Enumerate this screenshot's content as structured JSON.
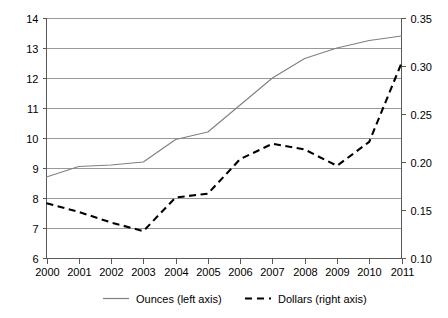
{
  "chart_data": {
    "type": "line",
    "title": "",
    "subtitle": "",
    "xlabel": "",
    "ylabel": "",
    "grid": true,
    "legend_position": "bottom",
    "categories": [
      "2000",
      "2001",
      "2002",
      "2003",
      "2004",
      "2005",
      "2006",
      "2007",
      "2008",
      "2009",
      "2010",
      "2011"
    ],
    "left_axis": {
      "label": "Ounces (left axis)",
      "ylim": [
        6,
        14
      ],
      "ticks": [
        "6",
        "7",
        "8",
        "9",
        "10",
        "11",
        "12",
        "13",
        "14"
      ],
      "tick_values": [
        6,
        7,
        8,
        9,
        10,
        11,
        12,
        13,
        14
      ]
    },
    "right_axis": {
      "label": "Dollars (right axis)",
      "ylim": [
        0.1,
        0.35
      ],
      "ticks": [
        "0.10",
        "0.15",
        "0.20",
        "0.25",
        "0.30",
        "0.35"
      ],
      "tick_values": [
        0.1,
        0.15,
        0.2,
        0.25,
        0.3,
        0.35
      ]
    },
    "series": [
      {
        "name": "Ounces (left axis)",
        "axis": "left",
        "style": "solid",
        "color": "#7f7f7f",
        "values": [
          8.7,
          9.05,
          9.1,
          9.2,
          9.95,
          10.2,
          11.1,
          12.0,
          12.65,
          13.0,
          13.25,
          13.4
        ]
      },
      {
        "name": "Dollars (right axis)",
        "axis": "right",
        "style": "dashed",
        "color": "#000000",
        "values": [
          0.157,
          0.148,
          0.137,
          0.128,
          0.163,
          0.167,
          0.203,
          0.219,
          0.213,
          0.196,
          0.221,
          0.303
        ]
      }
    ]
  },
  "legend": {
    "entries": [
      {
        "label": "Ounces (left axis)",
        "style": "solid"
      },
      {
        "label": "Dollars (right axis)",
        "style": "dashed"
      }
    ]
  }
}
